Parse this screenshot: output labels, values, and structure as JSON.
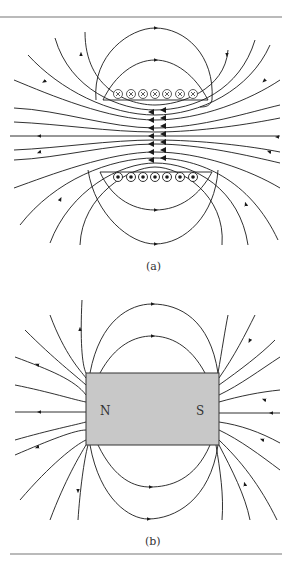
{
  "figure": {
    "panel_a": {
      "label": "(a)",
      "description": "Magnetic field lines of a solenoid",
      "top_coils_symbol": "⊗",
      "bottom_coils_symbol": "⊙",
      "coil_count": 7
    },
    "panel_b": {
      "label": "(b)",
      "description": "Magnetic field lines of a bar magnet",
      "north_label": "N",
      "south_label": "S",
      "magnet_fill": "#c8c8c8"
    },
    "line_color": "#1a1a1a",
    "rule_color": "#777777"
  }
}
